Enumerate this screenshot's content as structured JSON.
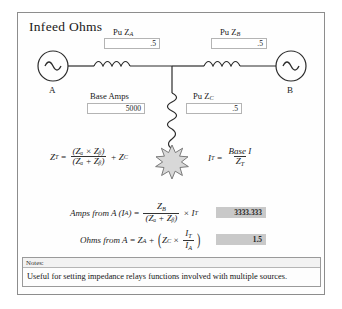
{
  "panel": {
    "title": "Infeed Ohms"
  },
  "sources": {
    "left_label": "A",
    "right_label": "B",
    "icon_left": "ac-source-icon",
    "icon_right": "ac-source-icon",
    "fault_icon": "fault-burst-icon"
  },
  "inputs": [
    {
      "name": "pu-za",
      "label": "Pu Z",
      "sub": "A",
      "value": ".5"
    },
    {
      "name": "pu-zb",
      "label": "Pu Z",
      "sub": "B",
      "value": ".5"
    },
    {
      "name": "base-amps",
      "label": "Base Amps",
      "sub": "",
      "value": "5000"
    },
    {
      "name": "pu-zc",
      "label": "Pu Z",
      "sub": "C",
      "value": ".5"
    }
  ],
  "formulas": {
    "zt": {
      "lhs": "Z",
      "lhs_sub": "T",
      "eq": "=",
      "num": "(Zₐ × Zᵦ)",
      "den": "(Zₐ + Zᵦ)",
      "plus": "+ Z",
      "plus_sub": "C"
    },
    "it": {
      "lhs": "I",
      "lhs_sub": "T",
      "eq": "=",
      "num": "Base I",
      "den": "Z",
      "den_sub": "T"
    },
    "amps_from_a": {
      "label": "Amps from A",
      "arg_open": "(",
      "arg": "I",
      "arg_sub": "A",
      "arg_close": ")",
      "eq": "=",
      "num": "Z",
      "num_sub": "B",
      "den": "(Zₐ + Zᵦ)",
      "times": "× I",
      "times_sub": "T"
    },
    "ohms_from_a": {
      "label": "Ohms from A",
      "eq": "=",
      "lhs": "Z",
      "lhs_sub": "A",
      "plus": "+",
      "inner_lhs": "Z",
      "inner_lhs_sub": "C",
      "times": "×",
      "num": "I",
      "num_sub": "T",
      "den": "I",
      "den_sub": "A"
    }
  },
  "results": [
    {
      "name": "amps-from-a-result",
      "value": "3333.333"
    },
    {
      "name": "ohms-from-a-result",
      "value": "1.5"
    }
  ],
  "notes": {
    "header": "Notes:",
    "text": "Useful for setting impedance relays functions involved with multiple sources."
  },
  "colors": {
    "frame": "#8d8d8d",
    "field_border": "#b4b4b4",
    "result_bg": "#c9c9c9",
    "wire": "#2b2b2b",
    "page_bg": "#ffffff"
  }
}
